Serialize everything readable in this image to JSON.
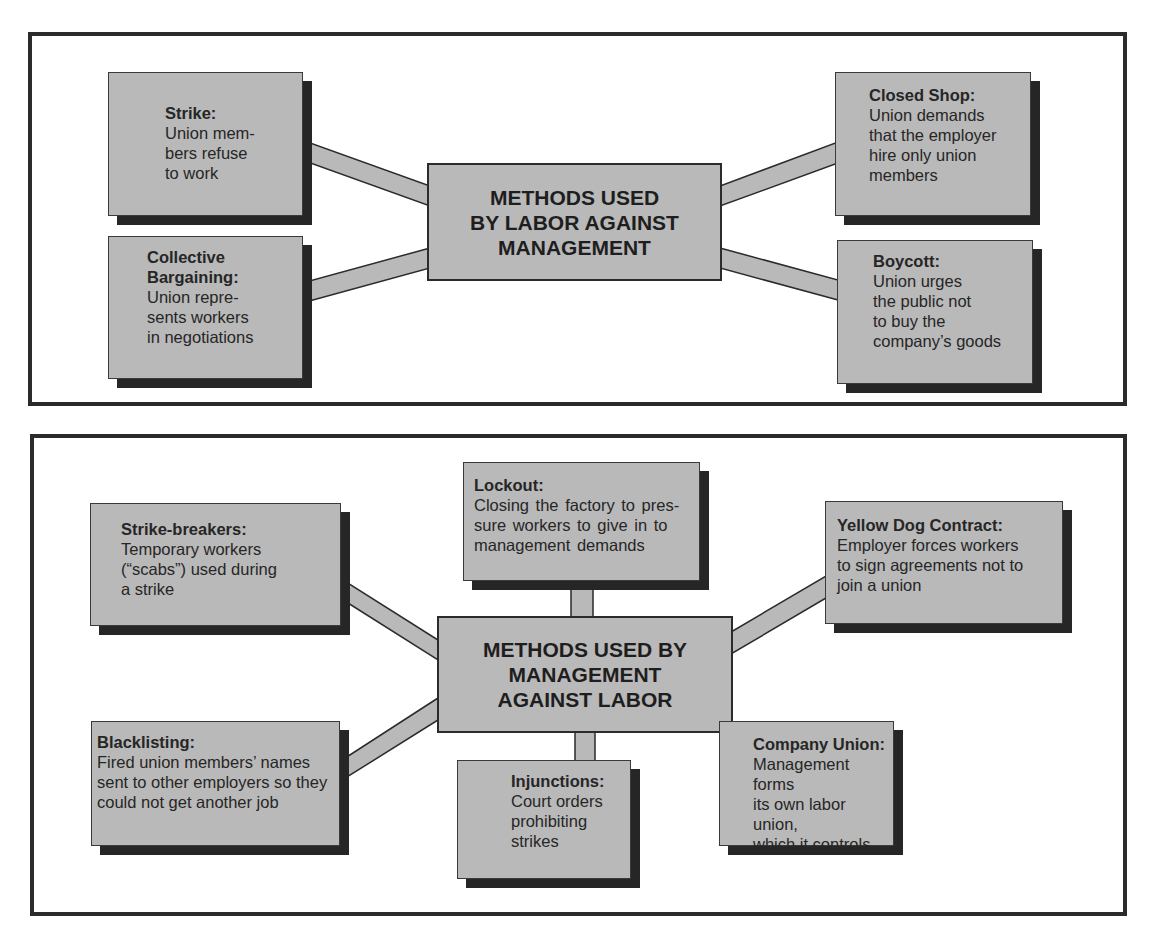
{
  "colors": {
    "box_fill": "#b9b9b9",
    "shadow": "#262626",
    "border": "#2b2b2b",
    "background": "#ffffff"
  },
  "labor_panel": {
    "center": "METHODS USED\nBY LABOR AGAINST\nMANAGEMENT",
    "nodes": [
      {
        "title": "Strike:",
        "text": "Union mem-\nbers refuse\nto work"
      },
      {
        "title": "Collective\nBargaining:",
        "text": "Union repre-\nsents workers\nin negotiations"
      },
      {
        "title": "Closed Shop:",
        "text": "Union demands\nthat the employer\nhire only union\nmembers"
      },
      {
        "title": "Boycott:",
        "text": "Union urges\nthe public not\nto buy the\ncompany’s goods"
      }
    ]
  },
  "management_panel": {
    "center": "METHODS USED BY\nMANAGEMENT\nAGAINST LABOR",
    "nodes": [
      {
        "title": "Strike-breakers:",
        "text": "Temporary workers\n(“scabs”) used during\na  strike"
      },
      {
        "title": "Lockout:",
        "text": "Closing the factory to pres-\nsure workers to give in to\nmanagement demands"
      },
      {
        "title": "Yellow Dog Contract:",
        "text": "Employer forces workers\nto sign agreements not to\njoin a union"
      },
      {
        "title": "Blacklisting:",
        "text": "Fired union members’ names\nsent to other employers so they\ncould not get another job"
      },
      {
        "title": "Injunctions:",
        "text": "Court orders\nprohibiting\nstrikes"
      },
      {
        "title": "Company Union:",
        "text": "Management forms\nits own labor union,\nwhich it controls"
      }
    ]
  }
}
